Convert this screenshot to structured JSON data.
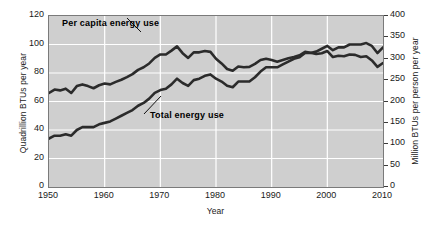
{
  "chart_data": {
    "type": "line",
    "title": "",
    "xlabel": "Year",
    "ylabel": "Quadrillion BTUs per year",
    "ylabel_right": "Million BTUs per person per year",
    "xlim": [
      1950,
      2010
    ],
    "ylim": [
      0,
      120
    ],
    "ylim_right": [
      0,
      400
    ],
    "grid": true,
    "legend_position": "inline-annotations",
    "xticks": [
      "1950",
      "1960",
      "1970",
      "1980",
      "1990",
      "2000",
      "2010"
    ],
    "yticks_left": [
      "0",
      "20",
      "40",
      "60",
      "80",
      "100",
      "120"
    ],
    "yticks_right": [
      "0",
      "50",
      "100",
      "150",
      "200",
      "250",
      "300",
      "350",
      "400"
    ],
    "annotations": [
      {
        "text": "Per capita energy use",
        "series": "per_capita_energy_use"
      },
      {
        "text": "Total energy use",
        "series": "total_energy_use"
      }
    ],
    "x": [
      1950,
      1951,
      1952,
      1953,
      1954,
      1955,
      1956,
      1957,
      1958,
      1959,
      1960,
      1961,
      1962,
      1963,
      1964,
      1965,
      1966,
      1967,
      1968,
      1969,
      1970,
      1971,
      1972,
      1973,
      1974,
      1975,
      1976,
      1977,
      1978,
      1979,
      1980,
      1981,
      1982,
      1983,
      1984,
      1985,
      1986,
      1987,
      1988,
      1989,
      1990,
      1991,
      1992,
      1993,
      1994,
      1995,
      1996,
      1997,
      1998,
      1999,
      2000,
      2001,
      2002,
      2003,
      2004,
      2005,
      2006,
      2007,
      2008,
      2009,
      2010
    ],
    "series": [
      {
        "name": "Per capita energy use",
        "axis": "right",
        "units": "Million BTUs per person per year",
        "values": [
          220,
          228,
          226,
          230,
          220,
          236,
          240,
          236,
          231,
          238,
          242,
          240,
          246,
          251,
          257,
          264,
          274,
          280,
          289,
          302,
          310,
          310,
          319,
          329,
          313,
          302,
          315,
          315,
          318,
          316,
          300,
          289,
          276,
          272,
          282,
          280,
          281,
          288,
          297,
          300,
          297,
          293,
          297,
          301,
          304,
          308,
          316,
          314,
          311,
          313,
          318,
          304,
          307,
          306,
          310,
          309,
          304,
          306,
          296,
          281,
          290
        ]
      },
      {
        "name": "Total energy use",
        "axis": "left",
        "units": "Quadrillion BTUs per year",
        "values": [
          34,
          36,
          36,
          37,
          36,
          40,
          42,
          42,
          42,
          44,
          45,
          46,
          48,
          50,
          52,
          54,
          57,
          59,
          62,
          66,
          68,
          69,
          72,
          76,
          73,
          71,
          75,
          76,
          78,
          79,
          76,
          74,
          71,
          70,
          74,
          74,
          74,
          77,
          81,
          84,
          84,
          84,
          86,
          88,
          90,
          91,
          94,
          94,
          95,
          97,
          99,
          96,
          98,
          98,
          100,
          100,
          100,
          101,
          99,
          94,
          98
        ]
      }
    ]
  },
  "axes": {
    "left_title": "Quadrillion BTUs per year",
    "right_title": "Million BTUs per person per year",
    "x_title": "Year"
  },
  "colors": {
    "plot_background": "#cfcfcf",
    "gridline": "#ffffff",
    "line": "#2b2b2b",
    "frame": "#7a7a7a",
    "text": "#1a1a1a"
  }
}
